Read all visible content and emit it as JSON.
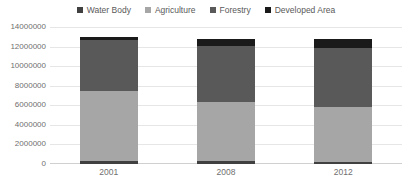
{
  "chart_data": {
    "type": "bar",
    "stacked": true,
    "title": "",
    "subtitle": "",
    "xlabel": "",
    "ylabel": "",
    "categories": [
      "2001",
      "2008",
      "2012"
    ],
    "series": [
      {
        "name": "Water Body",
        "color": "#404040",
        "values": [
          260000,
          280000,
          250000
        ]
      },
      {
        "name": "Agriculture",
        "color": "#a6a6a6",
        "values": [
          7180000,
          6060000,
          5580000
        ]
      },
      {
        "name": "Forestry",
        "color": "#595959",
        "values": [
          5190000,
          5720000,
          6020000
        ]
      },
      {
        "name": "Developed Area",
        "color": "#1a1a1a",
        "values": [
          370000,
          740000,
          900000
        ]
      }
    ],
    "ylim": [
      0,
      14000000
    ],
    "ytick_labels": [
      "14000000",
      "12000000",
      "10000000",
      "8000000",
      "6000000",
      "4000000",
      "2000000",
      "0"
    ],
    "ytick_values": [
      14000000,
      12000000,
      10000000,
      8000000,
      6000000,
      4000000,
      2000000,
      0
    ],
    "grid": true,
    "legend_position": "top"
  },
  "legend": {
    "items": [
      {
        "label": "Water Body",
        "color": "#404040"
      },
      {
        "label": "Agriculture",
        "color": "#a6a6a6"
      },
      {
        "label": "Forestry",
        "color": "#595959"
      },
      {
        "label": "Developed Area",
        "color": "#1a1a1a"
      }
    ]
  },
  "colors": {
    "gridline": "#e6e6e6",
    "axis": "#d0d0d0",
    "tick_text": "#6f6f6f",
    "legend_text": "#595959",
    "background": "#ffffff"
  }
}
